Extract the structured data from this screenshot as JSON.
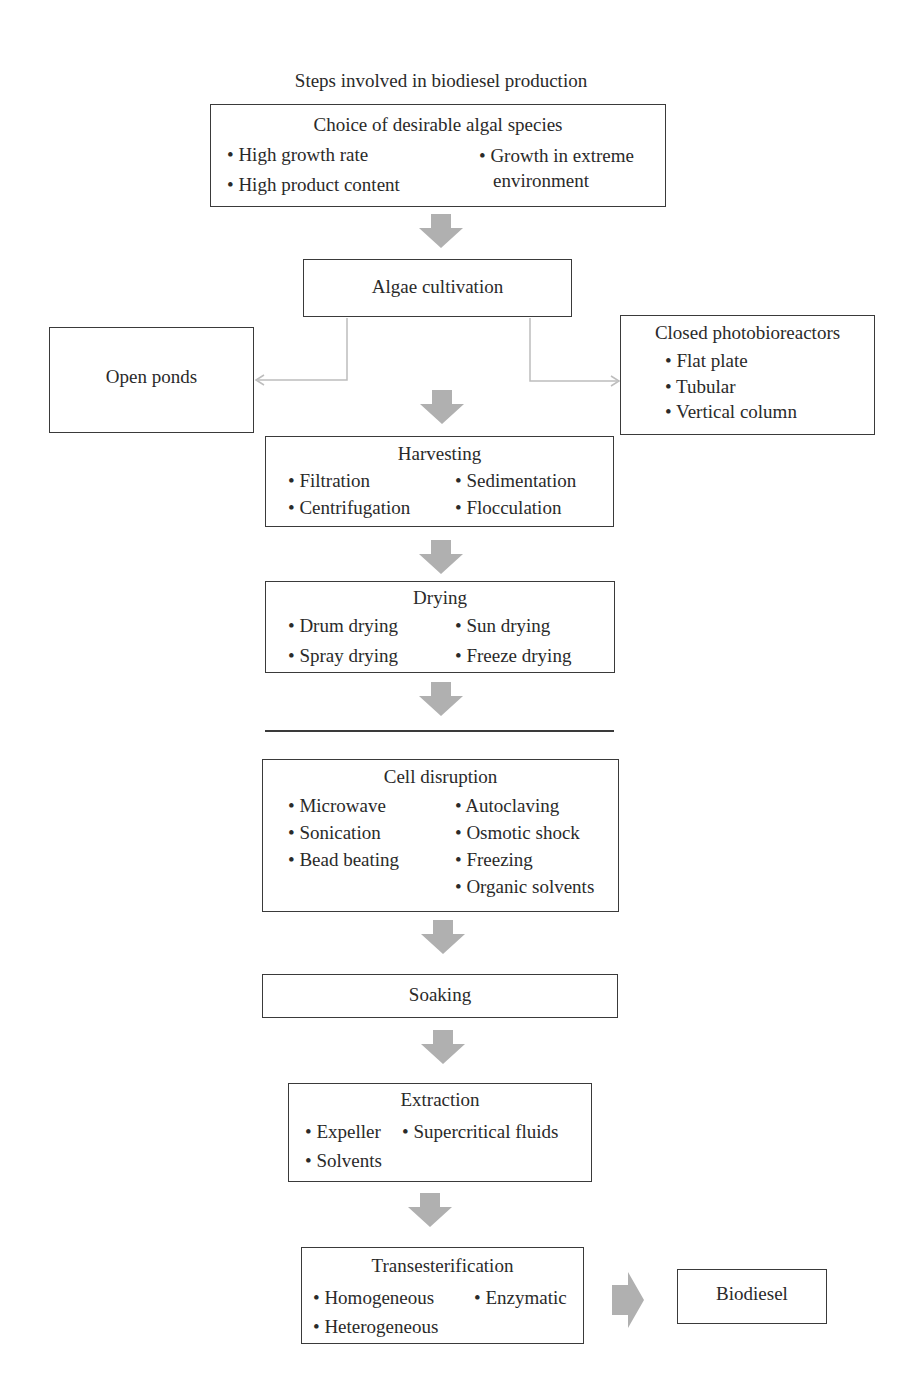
{
  "caption": "Steps involved in biodiesel production",
  "nodes": {
    "species": {
      "title": "Choice of desirable algal species",
      "items": [
        "• High growth rate",
        "• High product content",
        "• Growth in extreme",
        "environment"
      ]
    },
    "cultivation": {
      "title": "Algae cultivation"
    },
    "open_ponds": {
      "title": "Open ponds"
    },
    "closed_pbr": {
      "title": "Closed photobioreactors",
      "items": [
        "• Flat plate",
        "• Tubular",
        "• Vertical column"
      ]
    },
    "harvesting": {
      "title": "Harvesting",
      "items": [
        "• Filtration",
        "• Centrifugation",
        "• Sedimentation",
        "• Flocculation"
      ]
    },
    "drying": {
      "title": "Drying",
      "items": [
        "• Drum drying",
        "• Spray drying",
        "• Sun drying",
        "• Freeze drying"
      ]
    },
    "cell_disruption": {
      "title": "Cell disruption",
      "items": [
        "• Microwave",
        "• Sonication",
        "• Bead beating",
        "• Autoclaving",
        "• Osmotic shock",
        "• Freezing",
        "• Organic solvents"
      ]
    },
    "soaking": {
      "title": "Soaking"
    },
    "extraction": {
      "title": "Extraction",
      "items": [
        "• Expeller",
        "• Solvents",
        "• Supercritical fluids"
      ]
    },
    "transesterification": {
      "title": "Transesterification",
      "items": [
        "• Homogeneous",
        "• Heterogeneous",
        "• Enzymatic"
      ]
    },
    "biodiesel": {
      "title": "Biodiesel"
    }
  },
  "colors": {
    "arrow": "#b0b0b0",
    "border": "#3a3a3a",
    "connector": "#bdbdbd"
  }
}
